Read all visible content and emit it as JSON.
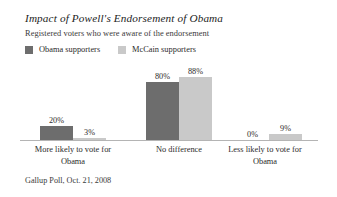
{
  "chart_data": {
    "type": "bar",
    "title": "Impact of Powell's Endorsement of Obama",
    "subtitle": "Registered voters who were aware of the endorsement",
    "source": "Gallup Poll, Oct. 21, 2008",
    "xlabel": "",
    "ylabel": "",
    "ylim": [
      0,
      100
    ],
    "grid": false,
    "legend_position": "top-left",
    "categories": [
      "More likely to vote for Obama",
      "No difference",
      "Less likely to vote for Obama"
    ],
    "category_lines": [
      [
        "More likely to vote for",
        "Obama"
      ],
      [
        "No difference",
        ""
      ],
      [
        "Less likely to vote for",
        "Obama"
      ]
    ],
    "series": [
      {
        "name": "Obama supporters",
        "color": "#6d6d6d",
        "values": [
          20,
          80,
          0
        ],
        "labels": [
          "20%",
          "80%",
          "0%"
        ]
      },
      {
        "name": "McCain supporters",
        "color": "#c9c9c9",
        "values": [
          3,
          88,
          9
        ],
        "labels": [
          "3%",
          "88%",
          "9%"
        ]
      }
    ]
  },
  "colors": {
    "obama": "#6d6d6d",
    "mccain": "#c9c9c9",
    "axis": "#b4b4b4",
    "text": "#2b2b2b",
    "background": "#ffffff"
  }
}
